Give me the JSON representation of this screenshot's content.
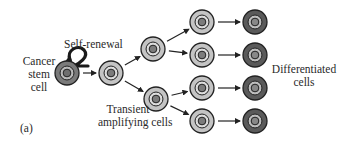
{
  "diagram": {
    "panel_label": "(a)",
    "labels": {
      "cancer_stem_cell": [
        "Cancer",
        "stem",
        "cell"
      ],
      "self_renewal": "Self-renewal",
      "transient_amplifying": [
        "Transient",
        "amplifying cells"
      ],
      "differentiated": [
        "Differentiated",
        "cells"
      ]
    },
    "nodes": [
      {
        "id": "csc",
        "type": "cancer-stem-cell",
        "cx": 67,
        "cy": 73
      },
      {
        "id": "ta1",
        "type": "transient-amplifying",
        "cx": 111,
        "cy": 73
      },
      {
        "id": "ta2a",
        "type": "transient-amplifying",
        "cx": 153,
        "cy": 49
      },
      {
        "id": "ta2b",
        "type": "transient-amplifying",
        "cx": 156,
        "cy": 99
      },
      {
        "id": "ta3a",
        "type": "transient-amplifying",
        "cx": 202,
        "cy": 22
      },
      {
        "id": "ta3b",
        "type": "transient-amplifying",
        "cx": 202,
        "cy": 55
      },
      {
        "id": "ta3c",
        "type": "transient-amplifying",
        "cx": 202,
        "cy": 88
      },
      {
        "id": "ta3d",
        "type": "transient-amplifying",
        "cx": 202,
        "cy": 121
      },
      {
        "id": "d1",
        "type": "differentiated",
        "cx": 255,
        "cy": 22
      },
      {
        "id": "d2",
        "type": "differentiated",
        "cx": 255,
        "cy": 55
      },
      {
        "id": "d3",
        "type": "differentiated",
        "cx": 255,
        "cy": 88
      },
      {
        "id": "d4",
        "type": "differentiated",
        "cx": 255,
        "cy": 121
      }
    ],
    "edges": [
      [
        "csc",
        "ta1"
      ],
      [
        "ta1",
        "ta2a"
      ],
      [
        "ta1",
        "ta2b"
      ],
      [
        "ta2a",
        "ta3a"
      ],
      [
        "ta2a",
        "ta3b"
      ],
      [
        "ta2b",
        "ta3c"
      ],
      [
        "ta2b",
        "ta3d"
      ],
      [
        "ta3a",
        "d1"
      ],
      [
        "ta3b",
        "d2"
      ],
      [
        "ta3c",
        "d3"
      ],
      [
        "ta3d",
        "d4"
      ]
    ],
    "colors": {
      "cancer-stem-cell": {
        "outer": "#7a7a7a",
        "ring": "#b8b8b8",
        "nucleus": "#6e6e6e"
      },
      "transient-amplifying": {
        "outer": "#c4c4c4",
        "ring": "#dcdcdc",
        "nucleus": "#7c7c7c"
      },
      "differentiated": {
        "outer": "#5a5a5a",
        "ring": "#bdbdbd",
        "nucleus": "#888888"
      },
      "stroke": "#222222"
    }
  }
}
